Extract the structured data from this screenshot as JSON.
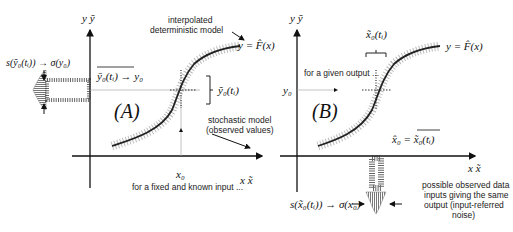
{
  "panel_a": {
    "label": "(A)",
    "axis_y": "y  ỹ",
    "axis_x": "x  x̃",
    "x0": "x₀",
    "mean_label": "ȳ₀(tᵢ) → y₀",
    "spread_label": "ỹ₀(tᵢ)",
    "sigma_label": "s(ỹ₀(tᵢ)) → σ(y₀)",
    "caption": "for a fixed and known input ...",
    "model_label": "y = F̂(x)",
    "interp_label_1": "interpolated",
    "interp_label_2": "deterministic model",
    "stoch_label_1": "stochastic model",
    "stoch_label_2": "(observed values)"
  },
  "panel_b": {
    "label": "(B)",
    "axis_y": "y  ỹ",
    "axis_x": "x  x̃",
    "y0": "y₀",
    "spread_label": "x̃₀(tᵢ)",
    "estimate_label": "x̂₀ = x̃₀(tᵢ)",
    "sigma_label": "s(x̃₀(tᵢ)) → σ(x₀)",
    "caption": "for a given output ...",
    "model_label": "y = F̂(x)",
    "note_1": "possible observed data",
    "note_2": "inputs giving the same",
    "note_3": "output (input-referred",
    "note_4": "noise)"
  },
  "colors": {
    "line": "#222222",
    "scatter": "#888888",
    "axis": "#111111",
    "guide": "#999999"
  }
}
